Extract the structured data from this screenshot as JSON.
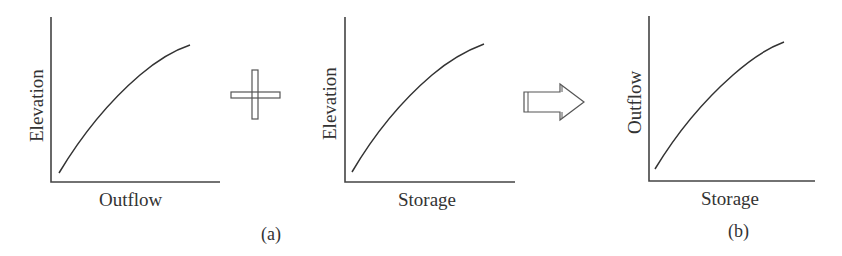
{
  "figure": {
    "panels": [
      {
        "id": "a1",
        "ylabel": "Elevation",
        "xlabel": "Outflow"
      },
      {
        "id": "a2",
        "ylabel": "Elevation",
        "xlabel": "Storage"
      },
      {
        "id": "b",
        "ylabel": "Outflow",
        "xlabel": "Storage"
      }
    ],
    "operators": {
      "plus": "plus-sign",
      "arrow": "right-arrow"
    },
    "captions": {
      "a": "(a)",
      "b": "(b)"
    }
  }
}
